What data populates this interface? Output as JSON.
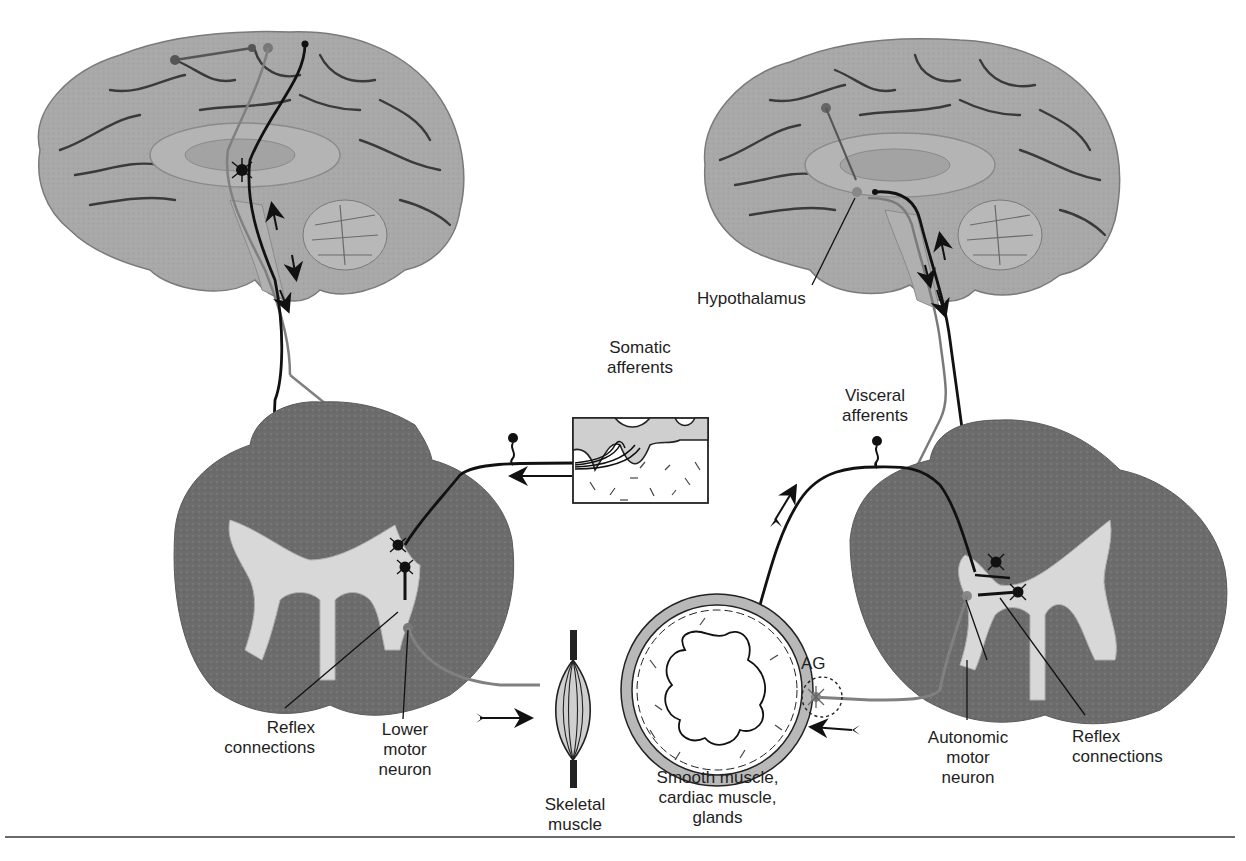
{
  "figure": {
    "panels": [
      {
        "id": "somatic",
        "title": "Somatic motor system",
        "labels": {
          "afferents": [
            "Somatic",
            "afferents"
          ],
          "reflex": [
            "Reflex",
            "connections"
          ],
          "lower_motor": [
            "Lower",
            "motor",
            "neuron"
          ],
          "target": [
            "Skeletal",
            "muscle"
          ]
        }
      },
      {
        "id": "autonomic",
        "title": "Autonomic motor system",
        "labels": {
          "hypothalamus": "Hypothalamus",
          "afferents": [
            "Visceral",
            "afferents"
          ],
          "ganglion": "AG",
          "autonomic_motor": [
            "Autonomic",
            "motor",
            "neuron"
          ],
          "reflex": [
            "Reflex",
            "connections"
          ],
          "target": [
            "Smooth muscle,",
            "cardiac muscle,",
            "glands"
          ]
        }
      }
    ],
    "colors": {
      "brain_fill": "#a9a9a9",
      "brain_sulcus": "#3c3c3c",
      "cord_white_matter": "#6e6e6e",
      "cord_gray_matter": "#d6d6d6",
      "pathway_dark": "#111111",
      "pathway_gray": "#7a7a7a",
      "epidermis": "#cfcfcf",
      "vessel_ring": "#b5b5b5"
    }
  }
}
